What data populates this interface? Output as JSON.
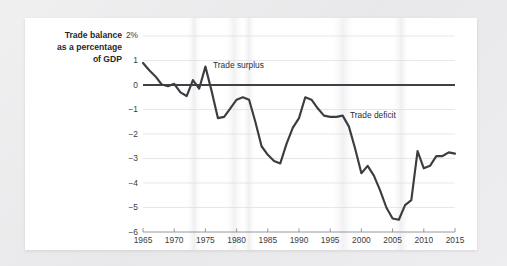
{
  "figure": {
    "background_color": "#ffffff",
    "page_color": "#ececee",
    "line_color": "#3b3d40",
    "zero_line_color": "#404247",
    "grid_color": "#d9d9dc",
    "axis_color": "#8d8f93",
    "text_color": "#2c2e31"
  },
  "chart_data": {
    "type": "line",
    "title": "",
    "subtitle": "",
    "xlabel": "",
    "ylabel": "Trade balance as a percentage of GDP",
    "ylabel_lines": [
      "Trade balance",
      "as a percentage",
      "of GDP"
    ],
    "xlim": [
      1965,
      2015
    ],
    "ylim": [
      -6,
      2
    ],
    "grid": true,
    "grid_axis": "y",
    "legend_position": "none",
    "y_ticks": [
      2,
      1,
      0,
      -1,
      -2,
      -3,
      -4,
      -5,
      -6
    ],
    "y_tick_labels": [
      "2%",
      "1",
      "0",
      "−1",
      "−2",
      "−3",
      "−4",
      "−5",
      "−6"
    ],
    "x_ticks": [
      1965,
      1970,
      1975,
      1980,
      1985,
      1990,
      1995,
      2000,
      2005,
      2010,
      2015
    ],
    "x_tick_labels": [
      "1965",
      "1970",
      "1975",
      "1980",
      "1985",
      "1990",
      "1995",
      "2000",
      "2005",
      "2010",
      "2015"
    ],
    "annotations": [
      {
        "text": "Trade surplus",
        "x": 1976.2,
        "y": 1.05,
        "anchor": "left"
      },
      {
        "text": "Trade deficit",
        "x": 1998.0,
        "y": -1.05,
        "anchor": "left"
      }
    ],
    "series": [
      {
        "name": "Trade balance as a percentage of GDP",
        "x": [
          1965,
          1966,
          1967,
          1968,
          1969,
          1970,
          1971,
          1972,
          1973,
          1974,
          1975,
          1976,
          1977,
          1978,
          1979,
          1980,
          1981,
          1982,
          1983,
          1984,
          1985,
          1986,
          1987,
          1988,
          1989,
          1990,
          1991,
          1992,
          1993,
          1994,
          1995,
          1996,
          1997,
          1998,
          1999,
          2000,
          2001,
          2002,
          2003,
          2004,
          2005,
          2006,
          2007,
          2008,
          2009,
          2010,
          2011,
          2012,
          2013,
          2014,
          2015
        ],
        "values": [
          0.9,
          0.6,
          0.35,
          0.02,
          -0.05,
          0.05,
          -0.3,
          -0.45,
          0.2,
          -0.15,
          0.75,
          -0.25,
          -1.35,
          -1.3,
          -0.95,
          -0.6,
          -0.5,
          -0.6,
          -1.5,
          -2.5,
          -2.85,
          -3.1,
          -3.2,
          -2.4,
          -1.75,
          -1.35,
          -0.5,
          -0.6,
          -0.95,
          -1.25,
          -1.3,
          -1.3,
          -1.25,
          -1.7,
          -2.6,
          -3.6,
          -3.3,
          -3.7,
          -4.3,
          -5.0,
          -5.45,
          -5.5,
          -4.9,
          -4.7,
          -2.7,
          -3.4,
          -3.3,
          -2.9,
          -2.9,
          -2.75,
          -2.8
        ]
      }
    ]
  }
}
